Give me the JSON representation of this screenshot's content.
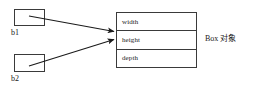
{
  "diagram": {
    "type": "object-reference-diagram",
    "background_color": "#ffffff",
    "stroke_color": "#3a3a3a",
    "text_color": "#1a1a1a",
    "references": [
      {
        "id": "b1",
        "label": "b1"
      },
      {
        "id": "b2",
        "label": "b2"
      }
    ],
    "object": {
      "caption": "Box 对象",
      "fields": [
        {
          "name": "width"
        },
        {
          "name": "height"
        },
        {
          "name": "depth"
        }
      ]
    },
    "arrows": [
      {
        "from": "b1",
        "to": "Box 对象"
      },
      {
        "from": "b2",
        "to": "Box 对象"
      }
    ]
  }
}
